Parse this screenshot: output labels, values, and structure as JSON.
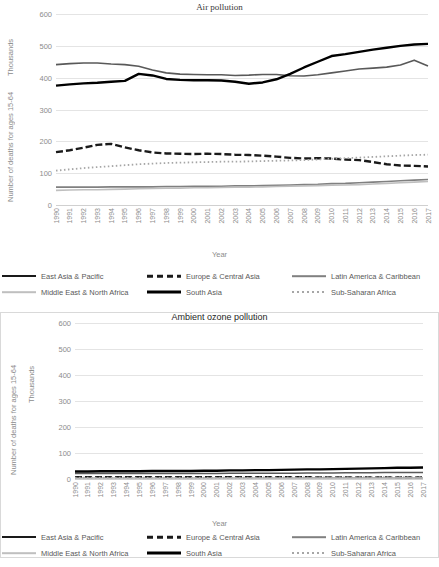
{
  "charts": [
    {
      "id": "air-pollution",
      "title": "Air pollution",
      "ylabel": "Number of deaths for ages 15-64",
      "yunit": "Thousands",
      "xlabel": "Year"
    },
    {
      "id": "ambient-ozone-pollution",
      "title": "Ambient ozone pollution",
      "ylabel": "Number of deaths for ages 15-64",
      "yunit": "Thousands",
      "xlabel": "Year"
    }
  ],
  "axis": {
    "yticks": [
      "600",
      "500",
      "400",
      "300",
      "200",
      "100",
      "0"
    ],
    "years": [
      "1990",
      "1991",
      "1992",
      "1993",
      "1994",
      "1995",
      "1996",
      "1997",
      "1998",
      "1999",
      "2000",
      "2001",
      "2002",
      "2003",
      "2004",
      "2005",
      "2006",
      "2007",
      "2008",
      "2009",
      "2010",
      "2011",
      "2012",
      "2013",
      "2014",
      "2015",
      "2016",
      "2017"
    ]
  },
  "legend": {
    "rows": [
      [
        {
          "label": "East Asia & Pacific",
          "key": "k-solid-dark"
        },
        {
          "label": "Europe & Central Asia",
          "key": "k-dash-dark"
        },
        {
          "label": "Latin America & Caribbean",
          "key": "k-solid-mid"
        }
      ],
      [
        {
          "label": "Middle East & North Africa",
          "key": "k-solid-light"
        },
        {
          "label": "South Asia",
          "key": "k-thick-dark"
        },
        {
          "label": "Sub-Saharan Africa",
          "key": "k-dot-mid"
        }
      ]
    ]
  },
  "colors": {
    "east_asia_pacific": "#595959",
    "europe_central_asia": "#1a1a1a",
    "latin_america_caribbean": "#808080",
    "middle_east_north_africa": "#bfbfbf",
    "south_asia": "#000000",
    "sub_saharan_africa": "#a6a6a6",
    "gridline": "#e4e4e4"
  },
  "chart_data": [
    {
      "type": "line",
      "title": "Air pollution",
      "xlabel": "Year",
      "ylabel": "Number of deaths for ages 15-64 (Thousands)",
      "ylim": [
        0,
        600
      ],
      "grid": true,
      "legend_position": "bottom",
      "x": [
        1990,
        1991,
        1992,
        1993,
        1994,
        1995,
        1996,
        1997,
        1998,
        1999,
        2000,
        2001,
        2002,
        2003,
        2004,
        2005,
        2006,
        2007,
        2008,
        2009,
        2010,
        2011,
        2012,
        2013,
        2014,
        2015,
        2016,
        2017
      ],
      "series": [
        {
          "name": "East Asia & Pacific",
          "values": [
            441,
            444,
            446,
            446,
            443,
            441,
            436,
            424,
            415,
            411,
            410,
            409,
            409,
            407,
            408,
            410,
            410,
            406,
            405,
            409,
            415,
            421,
            427,
            430,
            433,
            440,
            455,
            437
          ]
        },
        {
          "name": "Europe & Central Asia",
          "values": [
            166,
            172,
            180,
            189,
            192,
            181,
            172,
            165,
            162,
            161,
            160,
            161,
            160,
            158,
            157,
            155,
            152,
            148,
            146,
            147,
            146,
            143,
            141,
            135,
            128,
            124,
            123,
            121
          ]
        },
        {
          "name": "Latin America & Caribbean",
          "values": [
            56,
            56,
            56,
            56,
            57,
            57,
            57,
            57,
            58,
            58,
            59,
            59,
            59,
            60,
            60,
            61,
            62,
            63,
            64,
            65,
            67,
            68,
            70,
            72,
            74,
            76,
            78,
            80
          ]
        },
        {
          "name": "Middle East & North Africa",
          "values": [
            46,
            47,
            48,
            48,
            49,
            50,
            51,
            52,
            53,
            53,
            54,
            54,
            55,
            56,
            56,
            57,
            58,
            59,
            60,
            61,
            62,
            63,
            64,
            66,
            68,
            70,
            72,
            74
          ]
        },
        {
          "name": "South Asia",
          "values": [
            375,
            379,
            382,
            384,
            387,
            390,
            412,
            407,
            396,
            393,
            392,
            392,
            391,
            387,
            381,
            385,
            395,
            412,
            432,
            450,
            468,
            474,
            481,
            488,
            494,
            500,
            504,
            506
          ]
        },
        {
          "name": "Sub-Saharan Africa",
          "values": [
            108,
            112,
            116,
            119,
            122,
            125,
            128,
            130,
            132,
            133,
            134,
            135,
            136,
            136,
            137,
            138,
            139,
            140,
            141,
            143,
            145,
            147,
            149,
            151,
            153,
            155,
            157,
            158
          ]
        }
      ]
    },
    {
      "type": "line",
      "title": "Ambient ozone pollution",
      "xlabel": "Year",
      "ylabel": "Number of deaths for ages 15-64 (Thousands)",
      "ylim": [
        0,
        600
      ],
      "grid": true,
      "legend_position": "bottom",
      "x": [
        1990,
        1991,
        1992,
        1993,
        1994,
        1995,
        1996,
        1997,
        1998,
        1999,
        2000,
        2001,
        2002,
        2003,
        2004,
        2005,
        2006,
        2007,
        2008,
        2009,
        2010,
        2011,
        2012,
        2013,
        2014,
        2015,
        2016,
        2017
      ],
      "series": [
        {
          "name": "East Asia & Pacific",
          "values": [
            21,
            21,
            21,
            21,
            21,
            21,
            21,
            21,
            21,
            21,
            21,
            21,
            22,
            22,
            22,
            22,
            22,
            22,
            23,
            23,
            23,
            24,
            24,
            24,
            25,
            25,
            25,
            25
          ]
        },
        {
          "name": "Europe & Central Asia",
          "values": [
            7,
            7,
            7,
            7,
            7,
            7,
            7,
            7,
            7,
            7,
            7,
            7,
            7,
            7,
            7,
            7,
            7,
            7,
            7,
            6,
            6,
            6,
            6,
            6,
            6,
            6,
            6,
            6
          ]
        },
        {
          "name": "Latin America & Caribbean",
          "values": [
            3,
            3,
            3,
            3,
            3,
            3,
            3,
            3,
            3,
            3,
            3,
            3,
            3,
            3,
            3,
            3,
            3,
            3,
            4,
            4,
            4,
            4,
            4,
            4,
            4,
            4,
            4,
            4
          ]
        },
        {
          "name": "Middle East & North Africa",
          "values": [
            2,
            2,
            2,
            2,
            2,
            2,
            2,
            2,
            2,
            2,
            2,
            3,
            3,
            3,
            3,
            3,
            3,
            3,
            3,
            3,
            3,
            3,
            3,
            3,
            3,
            4,
            4,
            4
          ]
        },
        {
          "name": "South Asia",
          "values": [
            29,
            29,
            30,
            30,
            30,
            30,
            31,
            31,
            31,
            31,
            32,
            32,
            33,
            33,
            34,
            34,
            35,
            36,
            37,
            37,
            38,
            39,
            40,
            41,
            42,
            43,
            43,
            44
          ]
        },
        {
          "name": "Sub-Saharan Africa",
          "values": [
            5,
            5,
            5,
            5,
            5,
            5,
            5,
            5,
            5,
            5,
            5,
            5,
            5,
            5,
            6,
            6,
            6,
            6,
            6,
            6,
            6,
            6,
            7,
            7,
            7,
            7,
            7,
            7
          ]
        }
      ]
    }
  ],
  "footer": {
    "note": ""
  }
}
